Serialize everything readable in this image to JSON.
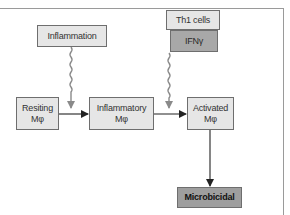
{
  "diagram": {
    "nodes": {
      "inflammation": {
        "label": "Inflammation"
      },
      "th1_cells": {
        "label": "Th1 cells"
      },
      "ifn_gamma": {
        "label": "IFNγ"
      },
      "resting_macrophage": {
        "line1": "Resiting",
        "line2": "Mφ"
      },
      "inflammatory_macrophage": {
        "line1": "Inflammatory",
        "line2": "Mφ"
      },
      "activated_macrophage": {
        "line1": "Activated",
        "line2": "Mφ"
      },
      "microbicidal": {
        "label": "Microbicidal"
      }
    },
    "edges": [
      {
        "from": "inflammation",
        "to": "resting_to_inflammatory_arrow",
        "style": "wavy"
      },
      {
        "from": "ifn_gamma",
        "to": "inflammatory_to_activated_arrow",
        "style": "wavy"
      },
      {
        "from": "resting_macrophage",
        "to": "inflammatory_macrophage",
        "style": "solid"
      },
      {
        "from": "inflammatory_macrophage",
        "to": "activated_macrophage",
        "style": "solid"
      },
      {
        "from": "activated_macrophage",
        "to": "microbicidal",
        "style": "solid"
      }
    ],
    "colors": {
      "box_fill": "#e6e6e6",
      "box_fill_dark": "#a8a8a8",
      "box_border": "#6e6e6e",
      "wavy_arrow": "#8a8a8a",
      "solid_arrow": "#222222"
    }
  }
}
